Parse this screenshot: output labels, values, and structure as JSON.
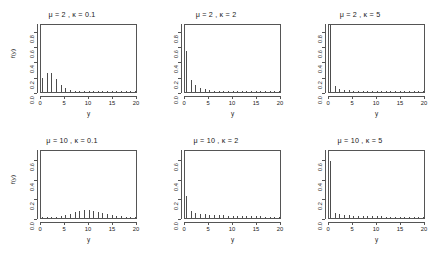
{
  "figure": {
    "layout": "2x3 grid of probability mass function bar plots",
    "rows": 2,
    "cols": 3
  },
  "chart_data": [
    {
      "type": "bar",
      "title": "μ = 2 , κ = 0.1",
      "mu": 2,
      "kappa": 0.1,
      "xlabel": "y",
      "ylabel": "f(y)",
      "xlim": [
        0,
        20
      ],
      "ylim": [
        0,
        0.9
      ],
      "xticks": [
        0,
        5,
        10,
        15,
        20
      ],
      "yticks": [
        0.0,
        0.2,
        0.4,
        0.6,
        0.8
      ],
      "ytick_labels": [
        "0.0",
        "0.2",
        "0.4",
        "0.6",
        "0.8"
      ],
      "grid": false,
      "legend": "none",
      "x": [
        0,
        1,
        2,
        3,
        4,
        5,
        6,
        7,
        8,
        9,
        10,
        11,
        12,
        13,
        14,
        15,
        16,
        17,
        18,
        19,
        20
      ],
      "values": [
        0.19,
        0.26,
        0.26,
        0.18,
        0.1,
        0.05,
        0.022,
        0.009,
        0.004,
        0.002,
        0.001,
        0.0005,
        0.0003,
        0.0002,
        0.0001,
        0.0001,
        0.0001,
        0.0001,
        0.0001,
        0.0001,
        0.0001
      ]
    },
    {
      "type": "bar",
      "title": "μ = 2 , κ = 2",
      "mu": 2,
      "kappa": 2,
      "xlabel": "y",
      "ylabel": "",
      "xlim": [
        0,
        20
      ],
      "ylim": [
        0,
        0.9
      ],
      "xticks": [
        0,
        5,
        10,
        15,
        20
      ],
      "yticks": [
        0.0,
        0.2,
        0.4,
        0.6,
        0.8
      ],
      "ytick_labels": [
        "0.0",
        "0.2",
        "0.4",
        "0.6",
        "0.8"
      ],
      "grid": false,
      "legend": "none",
      "x": [
        0,
        1,
        2,
        3,
        4,
        5,
        6,
        7,
        8,
        9,
        10,
        11,
        12,
        13,
        14,
        15,
        16,
        17,
        18,
        19,
        20
      ],
      "values": [
        0.55,
        0.16,
        0.09,
        0.06,
        0.04,
        0.027,
        0.019,
        0.014,
        0.01,
        0.008,
        0.006,
        0.005,
        0.004,
        0.003,
        0.003,
        0.002,
        0.002,
        0.002,
        0.001,
        0.001,
        0.001
      ]
    },
    {
      "type": "bar",
      "title": "μ = 2 , κ = 5",
      "mu": 2,
      "kappa": 5,
      "xlabel": "y",
      "ylabel": "",
      "xlim": [
        0,
        20
      ],
      "ylim": [
        0,
        0.9
      ],
      "xticks": [
        0,
        5,
        10,
        15,
        20
      ],
      "yticks": [
        0.0,
        0.2,
        0.4,
        0.6,
        0.8
      ],
      "ytick_labels": [
        "0.0",
        "0.2",
        "0.4",
        "0.6",
        "0.8"
      ],
      "grid": false,
      "legend": "none",
      "x": [
        0,
        1,
        2,
        3,
        4,
        5,
        6,
        7,
        8,
        9,
        10,
        11,
        12,
        13,
        14,
        15,
        16,
        17,
        18,
        19,
        20
      ],
      "values": [
        0.9,
        0.075,
        0.045,
        0.032,
        0.024,
        0.018,
        0.014,
        0.011,
        0.009,
        0.007,
        0.006,
        0.005,
        0.004,
        0.004,
        0.003,
        0.003,
        0.002,
        0.002,
        0.002,
        0.002,
        0.002
      ]
    },
    {
      "type": "bar",
      "title": "μ = 10 , κ = 0.1",
      "mu": 10,
      "kappa": 0.1,
      "xlabel": "y",
      "ylabel": "f(y)",
      "xlim": [
        0,
        20
      ],
      "ylim": [
        0,
        0.7
      ],
      "xticks": [
        0,
        5,
        10,
        15,
        20
      ],
      "yticks": [
        0.0,
        0.2,
        0.4,
        0.6
      ],
      "ytick_labels": [
        "0.0",
        "0.2",
        "0.4",
        "0.6"
      ],
      "grid": false,
      "legend": "none",
      "x": [
        0,
        1,
        2,
        3,
        4,
        5,
        6,
        7,
        8,
        9,
        10,
        11,
        12,
        13,
        14,
        15,
        16,
        17,
        18,
        19,
        20
      ],
      "values": [
        0.002,
        0.003,
        0.005,
        0.009,
        0.016,
        0.028,
        0.046,
        0.062,
        0.074,
        0.079,
        0.079,
        0.073,
        0.064,
        0.053,
        0.042,
        0.032,
        0.023,
        0.016,
        0.011,
        0.008,
        0.005
      ]
    },
    {
      "type": "bar",
      "title": "μ = 10 , κ = 2",
      "mu": 10,
      "kappa": 2,
      "xlabel": "y",
      "ylabel": "",
      "xlim": [
        0,
        20
      ],
      "ylim": [
        0,
        0.7
      ],
      "xticks": [
        0,
        5,
        10,
        15,
        20
      ],
      "yticks": [
        0.0,
        0.2,
        0.4,
        0.6
      ],
      "ytick_labels": [
        "0.0",
        "0.2",
        "0.4",
        "0.6"
      ],
      "grid": false,
      "legend": "none",
      "x": [
        0,
        1,
        2,
        3,
        4,
        5,
        6,
        7,
        8,
        9,
        10,
        11,
        12,
        13,
        14,
        15,
        16,
        17,
        18,
        19,
        20
      ],
      "values": [
        0.235,
        0.075,
        0.055,
        0.045,
        0.04,
        0.036,
        0.033,
        0.03,
        0.028,
        0.026,
        0.024,
        0.022,
        0.021,
        0.019,
        0.018,
        0.017,
        0.016,
        0.015,
        0.014,
        0.013,
        0.012
      ]
    },
    {
      "type": "bar",
      "title": "μ = 10 , κ = 5",
      "mu": 10,
      "kappa": 5,
      "xlabel": "y",
      "ylabel": "",
      "xlim": [
        0,
        20
      ],
      "ylim": [
        0,
        0.7
      ],
      "xticks": [
        0,
        5,
        10,
        15,
        20
      ],
      "yticks": [
        0.0,
        0.2,
        0.4,
        0.6
      ],
      "ytick_labels": [
        "0.0",
        "0.2",
        "0.4",
        "0.6"
      ],
      "grid": false,
      "legend": "none",
      "x": [
        0,
        1,
        2,
        3,
        4,
        5,
        6,
        7,
        8,
        9,
        10,
        11,
        12,
        13,
        14,
        15,
        16,
        17,
        18,
        19,
        20
      ],
      "values": [
        0.6,
        0.055,
        0.04,
        0.033,
        0.029,
        0.026,
        0.023,
        0.021,
        0.02,
        0.018,
        0.017,
        0.016,
        0.015,
        0.015,
        0.014,
        0.013,
        0.013,
        0.012,
        0.012,
        0.011,
        0.011
      ]
    }
  ],
  "style": {
    "bar_color": "#4d4d4d",
    "axis_color": "#555555",
    "text_color": "#1a1a1a",
    "background": "#ffffff"
  }
}
